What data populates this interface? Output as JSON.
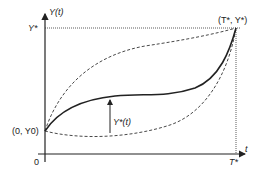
{
  "diagram": {
    "type": "trajectory-diagram",
    "labels": {
      "y_axis": "Y(t)",
      "x_axis": "t",
      "origin": "0",
      "y_star": "Y*",
      "t_star": "T*",
      "start_point": "(0, Y0)",
      "end_point": "(T*, Y*)",
      "optimal_path": "Y*(t)"
    },
    "curves": [
      {
        "name": "optimal-path",
        "style": "solid"
      },
      {
        "name": "upper-alternative-path",
        "style": "dashed"
      },
      {
        "name": "lower-alternative-path",
        "style": "dashed"
      }
    ],
    "colors": {
      "ink": "#222222",
      "background": "#ffffff"
    }
  }
}
